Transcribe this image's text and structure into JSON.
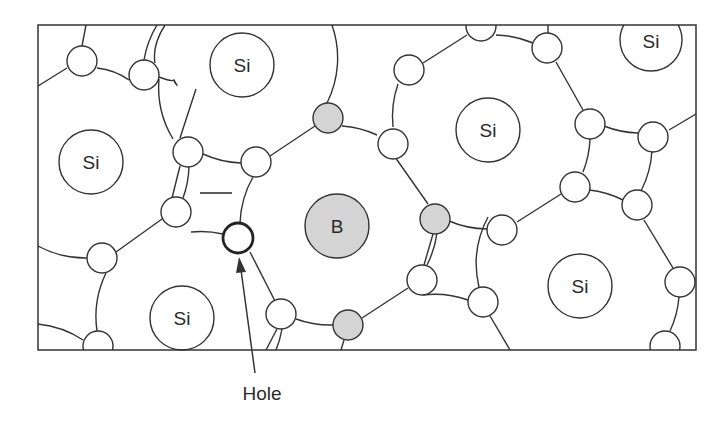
{
  "diagram": {
    "colors": {
      "line": "#333333",
      "electron_fill": "#ffffff",
      "boron_fill": "#d4d4d4",
      "acceptor_electron_fill": "#d4d4d4",
      "background": "#ffffff"
    },
    "frame": {
      "x": 38,
      "y": 25,
      "width": 658,
      "height": 325
    },
    "atoms": [
      {
        "label": "Si",
        "x": 242,
        "y": 65,
        "r": 32,
        "type": "silicon"
      },
      {
        "label": "Si",
        "x": 91,
        "y": 162,
        "r": 32,
        "type": "silicon"
      },
      {
        "label": "Si",
        "x": 488,
        "y": 130,
        "r": 32,
        "type": "silicon"
      },
      {
        "label": "Si",
        "x": 651,
        "y": 40,
        "r": 31,
        "type": "silicon"
      },
      {
        "label": "Si",
        "x": 182,
        "y": 318,
        "r": 32,
        "type": "silicon"
      },
      {
        "label": "Si",
        "x": 580,
        "y": 286,
        "r": 32,
        "type": "silicon"
      },
      {
        "label": "B",
        "x": 337,
        "y": 226,
        "r": 32,
        "type": "boron"
      }
    ],
    "negative_charge_symbol": "—",
    "hole_label": "Hole",
    "electron_count": 27,
    "acceptor_electron_count": 3
  }
}
